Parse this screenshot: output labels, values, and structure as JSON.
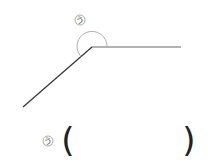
{
  "diagram": {
    "type": "angle",
    "angle_label": "う",
    "answer_label": "う",
    "answer_open": "(",
    "answer_close": ")",
    "answer_value": ""
  }
}
